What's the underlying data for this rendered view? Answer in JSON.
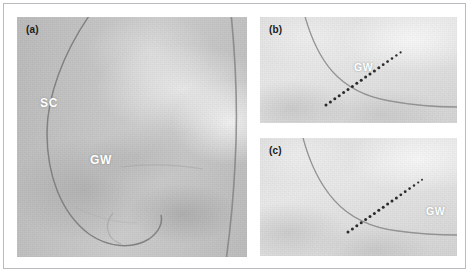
{
  "figure": {
    "type": "fluoroscopy-panel-figure",
    "panel_count": 3,
    "border_color": "#b9bcbe",
    "background": "#ffffff"
  },
  "panels": [
    {
      "id": "a",
      "label": "(a)",
      "label_color": "#1a1a1a",
      "annotations": [
        {
          "text": "SC",
          "color": "#ffffff",
          "meaning": "support-catheter"
        },
        {
          "text": "GW",
          "color": "#ffffff",
          "meaning": "guide-wire"
        }
      ],
      "features": {
        "catheter_curve": "large vertical loop from top-center curving left then down and right",
        "tone": "mid-gray radiograph with bright upper-right field"
      }
    },
    {
      "id": "b",
      "label": "(b)",
      "label_color": "#1a1a1a",
      "annotations": [
        {
          "text": "GW",
          "color": "#ffffff",
          "meaning": "guide-wire"
        }
      ],
      "features": {
        "catheter_curve": "arc descending from upper-left to lower-right",
        "marker_line": "dotted radiopaque marker track, lower-left to upper-right",
        "marker_dots": 18,
        "tone": "light-gray radiograph"
      }
    },
    {
      "id": "c",
      "label": "(c)",
      "label_color": "#1a1a1a",
      "annotations": [
        {
          "text": "GW",
          "color": "#ffffff",
          "meaning": "guide-wire"
        }
      ],
      "features": {
        "catheter_curve": "arc descending from upper-left to right edge",
        "marker_line": "dotted radiopaque marker track, lower-left to upper-right",
        "marker_dots": 18,
        "tone": "light-gray radiograph"
      }
    }
  ]
}
